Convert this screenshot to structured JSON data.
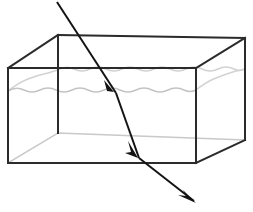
{
  "figure": {
    "background_color": "#ffffff",
    "width": 253,
    "height": 212
  },
  "colors": {
    "front_edge": "#2b2b2b",
    "back_edge": "#c9c9c9",
    "water_surface": "#c4c4c4",
    "water_surface_back": "#d2d2d2",
    "ray": "#141414"
  },
  "tank": {
    "label": "rectangular transparent tank",
    "front_face": {
      "label": "front face",
      "top_left": [
        8,
        68
      ],
      "top_right": [
        196,
        68
      ],
      "bottom_right": [
        196,
        163
      ],
      "bottom_left": [
        8,
        163
      ],
      "path": "M 8 68 L 196 68 L 196 163 L 8 163 Z"
    },
    "back_face": {
      "label": "back face",
      "top_left": [
        58,
        35
      ],
      "top_right": [
        245,
        35
      ],
      "bottom_right": [
        245,
        140
      ],
      "bottom_left": [
        58,
        133
      ],
      "path": "M 58 35 L 245 38 L 245 140 L 58 133 Z"
    },
    "connectors": {
      "label": "perspective connecting edges",
      "top_left": "M 8 68 L 58 35",
      "top_right": "M 196 68 L 245 38",
      "bottom_left": "M 8 163 L 58 133",
      "bottom_right": "M 196 163 L 245 140"
    },
    "visible_front_edges": [
      "M 8 68 L 196 68",
      "M 8 68 L 8 163",
      "M 196 68 L 196 163",
      "M 8 163 L 196 163",
      "M 8 68 L 58 35",
      "M 58 35 L 245 38",
      "M 196 68 L 245 38",
      "M 245 38 L 245 140",
      "M 196 163 L 245 140",
      "M 58 35 L 58 133"
    ],
    "hidden_back_edges": [
      "M 8 163 L 58 133",
      "M 58 133 L 245 140",
      "M 58 35 L 58 133"
    ]
  },
  "water": {
    "label": "water surface",
    "front_surface_y": 91,
    "back_surface_y": 70,
    "front_wave_path": "M 8 91 Q 16 86 24 90 Q 32 94 40 90 Q 48 86 56 90 Q 64 94 72 90 Q 80 86 88 90 Q 96 94 104 90 Q 112 86 120 90 Q 128 94 136 90 Q 144 86 152 90 Q 160 94 168 90 Q 176 86 184 90 Q 190 93 196 90",
    "back_wave_path": "M 58 70 Q 66 65 74 69 Q 82 73 90 69 Q 98 65 106 69 Q 114 73 122 69 Q 130 65 138 69 Q 146 73 154 69 Q 162 65 170 69 Q 178 73 186 69 Q 194 65 202 69 Q 210 73 218 69 Q 226 65 234 69 Q 240 72 245 69",
    "side_wave_path": "M 8 91 Q 18 83 28 79 Q 38 75 48 73 Q 54 71 58 70",
    "right_side_wave_path": "M 196 90 Q 206 82 216 78 Q 226 74 236 71 Q 241 70 245 69"
  },
  "light_ray": {
    "label": "incident and refracted light ray",
    "segments": [
      {
        "name": "incident-ray",
        "description": "incident ray in air entering from upper left",
        "from": [
          57,
          2
        ],
        "to": [
          116,
          93
        ],
        "arrowhead_at": [
          114,
          90
        ],
        "arrowhead_angle_deg": 57
      },
      {
        "name": "refracted-ray-in-water",
        "description": "refracted ray travelling through water",
        "from": [
          116,
          93
        ],
        "to": [
          139,
          158
        ],
        "arrowhead_at": [
          137,
          155
        ],
        "arrowhead_angle_deg": 70
      },
      {
        "name": "exit-ray",
        "description": "ray exiting the tank at the bottom toward lower right",
        "from": [
          139,
          158
        ],
        "to": [
          196,
          203
        ],
        "arrowhead_at": [
          196,
          203
        ],
        "arrowhead_angle_deg": 38
      }
    ]
  }
}
